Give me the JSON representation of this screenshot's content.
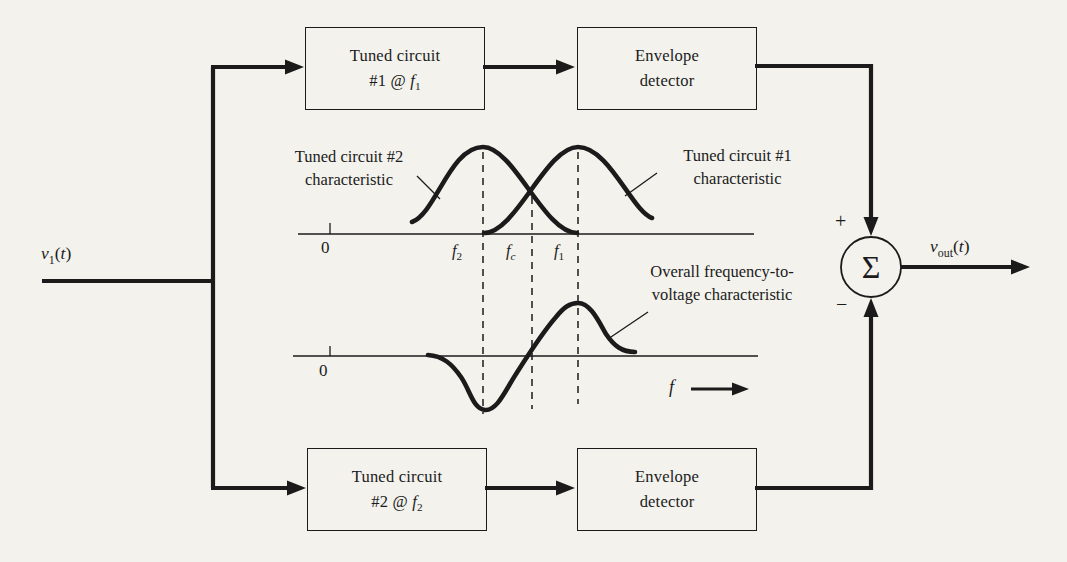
{
  "ink": "#1b1b1b",
  "paper": "#f3f2ed",
  "blocks": {
    "tuned1": {
      "line1": "Tuned circuit",
      "line2_pre": "#1 @ ",
      "var": "f",
      "sub": "1"
    },
    "envelope_top": {
      "line1": "Envelope",
      "line2": "detector"
    },
    "tuned2": {
      "line1": "Tuned circuit",
      "line2_pre": "#2 @ ",
      "var": "f",
      "sub": "2"
    },
    "envelope_bottom": {
      "line1": "Envelope",
      "line2": "detector"
    }
  },
  "signals": {
    "input": {
      "var": "v",
      "sub": "1",
      "arg_open": "(",
      "arg": "t",
      "arg_close": ")"
    },
    "output": {
      "var": "v",
      "sub": "out",
      "arg_open": "(",
      "arg": "t",
      "arg_close": ")"
    }
  },
  "summer": {
    "symbol": "Σ",
    "plus": "+",
    "minus": "−"
  },
  "plots": {
    "upper": {
      "zero": "0",
      "curve_left_label": [
        "Tuned circuit #2",
        "characteristic"
      ],
      "curve_right_label": [
        "Tuned circuit #1",
        "characteristic"
      ],
      "ticks": [
        {
          "var": "f",
          "sub": "2"
        },
        {
          "var": "f",
          "sub": "c"
        },
        {
          "var": "f",
          "sub": "1"
        }
      ]
    },
    "lower": {
      "zero": "0",
      "label": [
        "Overall frequency-to-",
        "voltage characteristic"
      ],
      "axis_var": "f"
    }
  }
}
